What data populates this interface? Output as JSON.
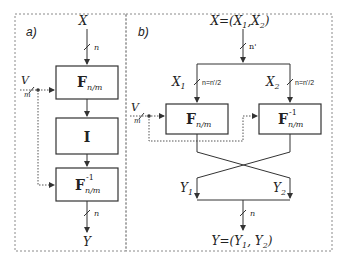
{
  "panel_a": {
    "label": "a)",
    "input": "X",
    "output": "Y",
    "bus_in": "n",
    "bus_out": "n",
    "side_input": "V",
    "side_width": "m",
    "blocks": [
      {
        "name": "F",
        "sub": "n/m",
        "sup": ""
      },
      {
        "name": "I",
        "sub": "",
        "sup": ""
      },
      {
        "name": "F",
        "sub": "n/m",
        "sup": "-1"
      }
    ]
  },
  "panel_b": {
    "label": "b)",
    "input": "X=(X",
    "input_full": "X=(X1,X2)",
    "bus_in": "n'",
    "branch_left": "X",
    "branch_left_sub": "1",
    "branch_right": "X",
    "branch_right_sub": "2",
    "branch_width": "n=n'/2",
    "side_input": "V",
    "side_width": "m",
    "blocks": [
      {
        "name": "F",
        "sub": "n/m",
        "sup": ""
      },
      {
        "name": "F",
        "sub": "n/m",
        "sup": "-1"
      }
    ],
    "out_left": "Y",
    "out_left_sub": "1",
    "out_right": "Y",
    "out_right_sub": "2",
    "bus_out": "n",
    "output_full": "Y=(Y1,Y2)"
  }
}
